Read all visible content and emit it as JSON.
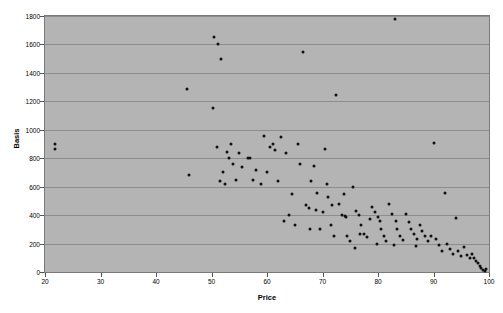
{
  "chart_data": {
    "type": "scatter",
    "title": "",
    "xlabel": "Price",
    "ylabel": "Basis",
    "xlim": [
      20,
      100
    ],
    "ylim": [
      0,
      1800
    ],
    "xticks": [
      20,
      30,
      40,
      50,
      60,
      70,
      80,
      90,
      100
    ],
    "yticks": [
      0,
      200,
      400,
      600,
      800,
      1000,
      1200,
      1400,
      1600,
      1800
    ],
    "grid": "horizontal",
    "legend": "none",
    "marker_color": "#101010",
    "plot_background": "#b4b4b4",
    "gridline_color": "#8d8d8d",
    "points": [
      [
        21.8,
        900
      ],
      [
        21.8,
        865
      ],
      [
        45.5,
        1285
      ],
      [
        46.0,
        685
      ],
      [
        50.3,
        1150
      ],
      [
        50.5,
        1655
      ],
      [
        51.2,
        1600
      ],
      [
        51.8,
        1500
      ],
      [
        51.0,
        880
      ],
      [
        51.5,
        640
      ],
      [
        52.0,
        700
      ],
      [
        52.5,
        620
      ],
      [
        52.8,
        845
      ],
      [
        53.2,
        800
      ],
      [
        53.8,
        760
      ],
      [
        54.5,
        650
      ],
      [
        55.0,
        835
      ],
      [
        55.5,
        735
      ],
      [
        56.5,
        800
      ],
      [
        57.0,
        805
      ],
      [
        58.0,
        720
      ],
      [
        59.0,
        620
      ],
      [
        59.5,
        955
      ],
      [
        60.5,
        880
      ],
      [
        61.0,
        900
      ],
      [
        61.5,
        860
      ],
      [
        62.5,
        950
      ],
      [
        63.5,
        840
      ],
      [
        64.0,
        400
      ],
      [
        64.5,
        545
      ],
      [
        65.5,
        900
      ],
      [
        66.0,
        760
      ],
      [
        66.5,
        1545
      ],
      [
        67.0,
        470
      ],
      [
        67.5,
        450
      ],
      [
        68.0,
        640
      ],
      [
        68.5,
        745
      ],
      [
        69.0,
        555
      ],
      [
        69.5,
        300
      ],
      [
        70.0,
        420
      ],
      [
        70.5,
        865
      ],
      [
        70.8,
        620
      ],
      [
        71.0,
        530
      ],
      [
        71.5,
        330
      ],
      [
        72.0,
        250
      ],
      [
        72.5,
        1245
      ],
      [
        73.0,
        480
      ],
      [
        73.5,
        400
      ],
      [
        74.0,
        395
      ],
      [
        74.2,
        390
      ],
      [
        74.5,
        250
      ],
      [
        75.0,
        215
      ],
      [
        75.5,
        600
      ],
      [
        76.0,
        430
      ],
      [
        76.5,
        400
      ],
      [
        77.0,
        330
      ],
      [
        77.5,
        270
      ],
      [
        78.0,
        245
      ],
      [
        78.5,
        370
      ],
      [
        79.0,
        455
      ],
      [
        79.5,
        420
      ],
      [
        80.0,
        390
      ],
      [
        80.3,
        360
      ],
      [
        80.5,
        300
      ],
      [
        81.0,
        250
      ],
      [
        81.5,
        215
      ],
      [
        82.0,
        480
      ],
      [
        82.5,
        405
      ],
      [
        83.0,
        1780
      ],
      [
        83.2,
        360
      ],
      [
        83.5,
        300
      ],
      [
        84.0,
        255
      ],
      [
        84.5,
        225
      ],
      [
        85.0,
        410
      ],
      [
        85.5,
        350
      ],
      [
        86.0,
        300
      ],
      [
        86.5,
        265
      ],
      [
        87.0,
        230
      ],
      [
        87.5,
        330
      ],
      [
        88.0,
        290
      ],
      [
        88.5,
        250
      ],
      [
        89.0,
        215
      ],
      [
        89.5,
        255
      ],
      [
        90.0,
        905
      ],
      [
        90.5,
        230
      ],
      [
        91.0,
        190
      ],
      [
        91.5,
        150
      ],
      [
        92.0,
        555
      ],
      [
        92.5,
        200
      ],
      [
        93.0,
        165
      ],
      [
        93.5,
        130
      ],
      [
        94.0,
        380
      ],
      [
        94.5,
        145
      ],
      [
        95.0,
        110
      ],
      [
        95.5,
        175
      ],
      [
        96.0,
        120
      ],
      [
        96.5,
        95
      ],
      [
        97.0,
        130
      ],
      [
        97.3,
        100
      ],
      [
        97.6,
        75
      ],
      [
        98.0,
        60
      ],
      [
        98.3,
        40
      ],
      [
        98.6,
        25
      ],
      [
        98.9,
        15
      ],
      [
        99.2,
        10
      ],
      [
        99.4,
        20
      ],
      [
        63.0,
        360
      ],
      [
        65.0,
        330
      ],
      [
        67.8,
        300
      ],
      [
        71.8,
        470
      ],
      [
        73.8,
        550
      ],
      [
        75.8,
        170
      ],
      [
        79.8,
        195
      ],
      [
        82.8,
        190
      ],
      [
        86.8,
        185
      ],
      [
        53.5,
        900
      ],
      [
        57.5,
        645
      ],
      [
        60.0,
        700
      ],
      [
        62.0,
        640
      ],
      [
        68.8,
        435
      ],
      [
        76.8,
        265
      ]
    ]
  }
}
